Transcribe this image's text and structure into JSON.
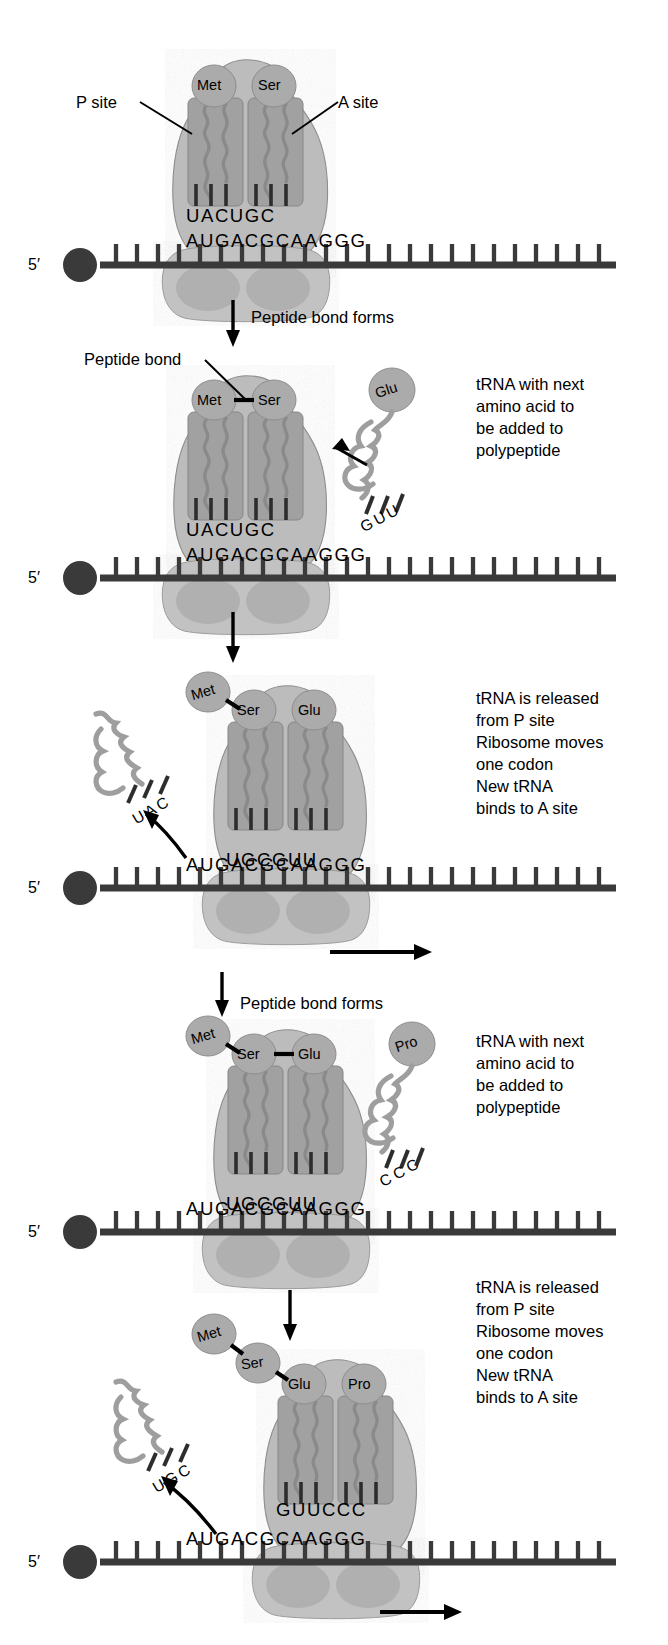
{
  "figure": {
    "background": "#ffffff",
    "ink": "#000000",
    "colors": {
      "ribosome_large": "#b9b9b9",
      "ribosome_small": "#bdbdbd",
      "site_block": "#9a9a9a",
      "trna_body": "#a8a8a8",
      "amino_acid_ball": "#a6a6a6",
      "mrna": "#3a3a3a",
      "free_trna": "#9e9e9e",
      "outline": "#7a7a7a"
    }
  },
  "labels": {
    "p_site": "P site",
    "a_site": "A site",
    "peptide_bond": "Peptide bond",
    "five_prime": "5′"
  },
  "steps": [
    {
      "id": "step-peptide-bond-1",
      "label": "Peptide bond forms"
    },
    {
      "id": "step-translocate-1",
      "label": ""
    },
    {
      "id": "step-peptide-bond-2",
      "label": "Peptide bond forms"
    },
    {
      "id": "step-translocate-2",
      "label": ""
    }
  ],
  "notes": {
    "trna_next_1": "tRNA with next\namino acid to\nbe added to\npolypeptide",
    "released_1": "tRNA is released\nfrom P site\nRibosome moves\none codon\nNew tRNA\nbinds to A site",
    "trna_next_2": "tRNA with next\namino acid to\nbe added to\npolypeptide",
    "released_2": "tRNA is released\nfrom P site\nRibosome moves\none codon\nNew tRNA\nbinds to A site"
  },
  "mrna": {
    "sequence": "AUGACGCAAGGG",
    "five_prime_label": "5′",
    "direction": "5' to 3' left to right"
  },
  "panels": [
    {
      "id": "panel-1",
      "name": "initiation-two-trnas-bound",
      "p_site": {
        "amino_acid": "Met",
        "anticodon": "UAC"
      },
      "a_site": {
        "amino_acid": "Ser",
        "anticodon": "UGC"
      },
      "anticodon_row": "UACUGC",
      "codon_row": "AUGACGCAAGGG",
      "incoming_trna": null,
      "released_trna": null,
      "peptide_chain": [
        "Met",
        "Ser"
      ],
      "show_move_arrow": false,
      "callouts": [
        "P site",
        "A site"
      ]
    },
    {
      "id": "panel-2",
      "name": "peptide-bond-met-ser",
      "p_site": {
        "amino_acid": "Met",
        "anticodon": "UAC"
      },
      "a_site": {
        "amino_acid": "Ser",
        "anticodon": "UGC"
      },
      "anticodon_row": "UACUGC",
      "codon_row": "AUGACGCAAGGG",
      "incoming_trna": {
        "amino_acid": "Glu",
        "anticodon": "GUU"
      },
      "released_trna": null,
      "peptide_chain": [
        "Met",
        "Ser"
      ],
      "peptide_bond_callout": "Peptide bond",
      "show_move_arrow": false
    },
    {
      "id": "panel-3",
      "name": "translocation-glu-enters",
      "p_site": {
        "amino_acid": "Ser",
        "anticodon": "UGC"
      },
      "a_site": {
        "amino_acid": "Glu",
        "anticodon": "GUU"
      },
      "anticodon_row": "UGCGUU",
      "codon_row": "AUGACGCAAGGG",
      "incoming_trna": null,
      "released_trna": {
        "anticodon": "UAC"
      },
      "peptide_chain": [
        "Met",
        "Ser",
        "Glu"
      ],
      "show_move_arrow": true
    },
    {
      "id": "panel-4",
      "name": "peptide-bond-ser-glu",
      "p_site": {
        "amino_acid": "Ser",
        "anticodon": "UGC"
      },
      "a_site": {
        "amino_acid": "Glu",
        "anticodon": "GUU"
      },
      "anticodon_row": "UGCGUU",
      "codon_row": "AUGACGCAAGGG",
      "incoming_trna": {
        "amino_acid": "Pro",
        "anticodon": "CCC"
      },
      "released_trna": null,
      "peptide_chain": [
        "Met",
        "Ser",
        "Glu"
      ],
      "show_move_arrow": false
    },
    {
      "id": "panel-5",
      "name": "translocation-pro-enters",
      "p_site": {
        "amino_acid": "Glu",
        "anticodon": "GUU"
      },
      "a_site": {
        "amino_acid": "Pro",
        "anticodon": "CCC"
      },
      "anticodon_row": "GUUCCC",
      "codon_row": "AUGACGCAAGGG",
      "incoming_trna": null,
      "released_trna": {
        "anticodon": "UGC"
      },
      "peptide_chain": [
        "Met",
        "Ser",
        "Glu",
        "Pro"
      ],
      "show_move_arrow": true
    }
  ],
  "amino_acids": {
    "met": "Met",
    "ser": "Ser",
    "glu": "Glu",
    "pro": "Pro"
  },
  "anticodons": {
    "uac": "UAC",
    "ugc": "UGC",
    "guu": "GUU",
    "ccc": "CCC"
  }
}
